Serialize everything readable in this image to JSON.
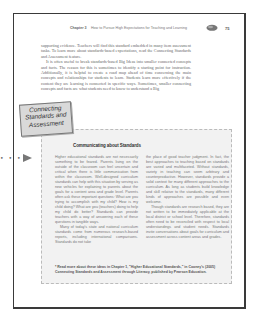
{
  "header": {
    "chapter": "Chapter 3",
    "title": "How to Pursue High Expectations for Teaching and Learning",
    "icon": "apple-icon",
    "page_number": "75"
  },
  "body": {
    "paragraphs": [
      "supporting evidence. Teachers will find this standard embedded in many item assessment tasks. To learn more about standards-based expectations, read the Connecting Standards and Assessment feature.",
      "It is often useful to break standards-based Big Ideas into smaller connected concepts and facts. The reason for this is sometimes to identify a starting point for instruction. Additionally, it is helpful to create a road map ahead of time concerning the main concepts and relationships for students to learn. Students learn more effectively if the content they are learning is connected in specific ways. Sometimes, smaller connecting concepts and facts are what students need to know to understand a Big"
    ]
  },
  "margin_marker": {
    "dots": "• • •",
    "icon": "arrow-right-icon"
  },
  "callout": {
    "badge": [
      "Connecting",
      "Standards and",
      "Assessment"
    ],
    "heading": "Communicating about Standards",
    "left_column": [
      "Higher educational standards are not necessarily something to be feared. Parents living on the outside of the classroom can feel uncertain and critical when there is little communication from within the classroom. Well-designed curriculum standards can help with this situation by serving as new vehicles for explaining to parents about the goals for a content area and grade level. Parents often ask these important questions: What are you trying to accomplish with my child? How is my child doing? What are you (teachers) doing to help my child do better? Standards can provide teachers with a way of answering each of these questions in tangible ways.",
      "Many of today's state and national curriculum standards come from numerous research-based reports, including international comparisons. Standards do not take"
    ],
    "right_column": [
      "the place of good teacher judgment. In fact, the best approaches to teaching based on standards are varied and multifaceted. Without standards, variety in teaching can seem arbitrary and counterproductive. However, standards provide a solid context for many different approaches to the curriculum. As long as students build knowledge and skill relative to the standards, many different kinds of approaches are possible and even welcome.",
      "Though standards are research based, they are not written to be immediately applicable at the local district or school level. Therefore, standards often need to be reconciled with respect to local understandings and student needs. Standards invite conversations about goals for curriculum and assessment across content areas and grades."
    ],
    "footnote": "* Read more about these ideas in Chapter 1, \"Higher Educational Standards,\" in Cooney's (2005) Connecting Standards and Assessment through Literacy, published by Pearson Education."
  }
}
